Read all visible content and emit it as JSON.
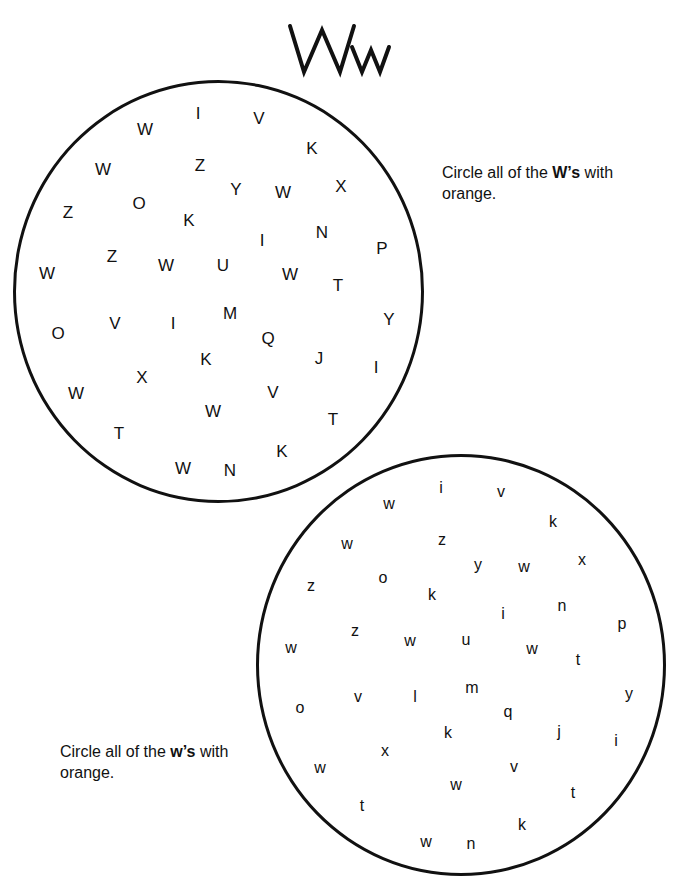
{
  "worksheet": {
    "title_upper": "W",
    "title_lower": "w",
    "instructions": {
      "upper": {
        "prefix": "Circle all of the ",
        "bold": "W’s",
        "suffix": " with",
        "line2": "orange."
      },
      "lower": {
        "prefix": "Circle all of the ",
        "bold": "w’s",
        "suffix": " with",
        "line2": "orange."
      }
    },
    "upper_circle_letters": [
      {
        "ch": "I",
        "x": 198,
        "y": 113
      },
      {
        "ch": "V",
        "x": 259,
        "y": 118
      },
      {
        "ch": "W",
        "x": 145,
        "y": 129
      },
      {
        "ch": "K",
        "x": 312,
        "y": 148
      },
      {
        "ch": "W",
        "x": 103,
        "y": 169
      },
      {
        "ch": "Z",
        "x": 200,
        "y": 165
      },
      {
        "ch": "Y",
        "x": 236,
        "y": 189
      },
      {
        "ch": "W",
        "x": 283,
        "y": 192
      },
      {
        "ch": "X",
        "x": 341,
        "y": 186
      },
      {
        "ch": "Z",
        "x": 68,
        "y": 212
      },
      {
        "ch": "O",
        "x": 139,
        "y": 203
      },
      {
        "ch": "K",
        "x": 189,
        "y": 220
      },
      {
        "ch": "I",
        "x": 262,
        "y": 240
      },
      {
        "ch": "N",
        "x": 322,
        "y": 232
      },
      {
        "ch": "P",
        "x": 382,
        "y": 248
      },
      {
        "ch": "Z",
        "x": 112,
        "y": 256
      },
      {
        "ch": "W",
        "x": 47,
        "y": 273
      },
      {
        "ch": "W",
        "x": 166,
        "y": 265
      },
      {
        "ch": "U",
        "x": 223,
        "y": 265
      },
      {
        "ch": "W",
        "x": 290,
        "y": 274
      },
      {
        "ch": "T",
        "x": 338,
        "y": 285
      },
      {
        "ch": "M",
        "x": 230,
        "y": 313
      },
      {
        "ch": "V",
        "x": 115,
        "y": 323
      },
      {
        "ch": "I",
        "x": 173,
        "y": 323
      },
      {
        "ch": "Y",
        "x": 389,
        "y": 319
      },
      {
        "ch": "O",
        "x": 58,
        "y": 333
      },
      {
        "ch": "Q",
        "x": 268,
        "y": 338
      },
      {
        "ch": "K",
        "x": 206,
        "y": 359
      },
      {
        "ch": "J",
        "x": 319,
        "y": 358
      },
      {
        "ch": "I",
        "x": 376,
        "y": 367
      },
      {
        "ch": "X",
        "x": 142,
        "y": 377
      },
      {
        "ch": "W",
        "x": 76,
        "y": 393
      },
      {
        "ch": "V",
        "x": 273,
        "y": 392
      },
      {
        "ch": "W",
        "x": 213,
        "y": 411
      },
      {
        "ch": "T",
        "x": 333,
        "y": 419
      },
      {
        "ch": "T",
        "x": 119,
        "y": 433
      },
      {
        "ch": "K",
        "x": 282,
        "y": 451
      },
      {
        "ch": "W",
        "x": 183,
        "y": 468
      },
      {
        "ch": "N",
        "x": 230,
        "y": 470
      }
    ],
    "lower_circle_letters": [
      {
        "ch": "i",
        "x": 441,
        "y": 488
      },
      {
        "ch": "v",
        "x": 501,
        "y": 492
      },
      {
        "ch": "w",
        "x": 389,
        "y": 504
      },
      {
        "ch": "k",
        "x": 553,
        "y": 522
      },
      {
        "ch": "w",
        "x": 347,
        "y": 544
      },
      {
        "ch": "z",
        "x": 442,
        "y": 540
      },
      {
        "ch": "y",
        "x": 478,
        "y": 565
      },
      {
        "ch": "w",
        "x": 524,
        "y": 567
      },
      {
        "ch": "x",
        "x": 582,
        "y": 560
      },
      {
        "ch": "z",
        "x": 311,
        "y": 586
      },
      {
        "ch": "o",
        "x": 383,
        "y": 578
      },
      {
        "ch": "k",
        "x": 432,
        "y": 595
      },
      {
        "ch": "i",
        "x": 503,
        "y": 614
      },
      {
        "ch": "n",
        "x": 562,
        "y": 606
      },
      {
        "ch": "p",
        "x": 622,
        "y": 624
      },
      {
        "ch": "z",
        "x": 355,
        "y": 631
      },
      {
        "ch": "w",
        "x": 291,
        "y": 648
      },
      {
        "ch": "w",
        "x": 410,
        "y": 641
      },
      {
        "ch": "u",
        "x": 466,
        "y": 640
      },
      {
        "ch": "w",
        "x": 532,
        "y": 649
      },
      {
        "ch": "t",
        "x": 578,
        "y": 660
      },
      {
        "ch": "m",
        "x": 472,
        "y": 688
      },
      {
        "ch": "v",
        "x": 358,
        "y": 697
      },
      {
        "ch": "l",
        "x": 415,
        "y": 697
      },
      {
        "ch": "y",
        "x": 629,
        "y": 694
      },
      {
        "ch": "o",
        "x": 300,
        "y": 708
      },
      {
        "ch": "q",
        "x": 508,
        "y": 712
      },
      {
        "ch": "k",
        "x": 448,
        "y": 733
      },
      {
        "ch": "j",
        "x": 559,
        "y": 732
      },
      {
        "ch": "i",
        "x": 616,
        "y": 741
      },
      {
        "ch": "x",
        "x": 385,
        "y": 751
      },
      {
        "ch": "w",
        "x": 320,
        "y": 768
      },
      {
        "ch": "v",
        "x": 514,
        "y": 767
      },
      {
        "ch": "w",
        "x": 456,
        "y": 785
      },
      {
        "ch": "t",
        "x": 573,
        "y": 793
      },
      {
        "ch": "t",
        "x": 362,
        "y": 806
      },
      {
        "ch": "k",
        "x": 522,
        "y": 825
      },
      {
        "ch": "w",
        "x": 426,
        "y": 842
      },
      {
        "ch": "n",
        "x": 471,
        "y": 844
      }
    ]
  }
}
